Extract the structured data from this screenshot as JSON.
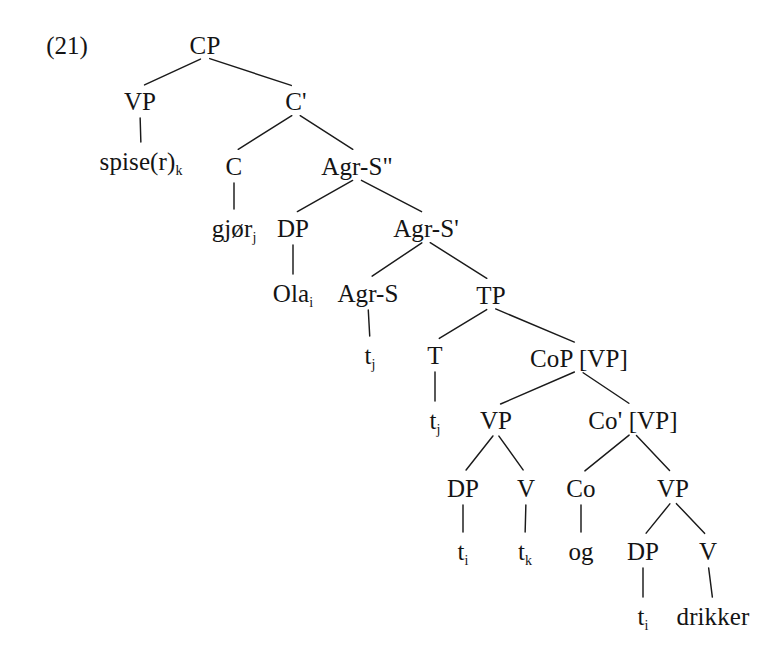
{
  "figure": {
    "example_number": "(21)",
    "language": "Norwegian",
    "sentence_gloss": "Ola gjør spise(r) og drikker",
    "width": 777,
    "height": 658,
    "background_color": "#ffffff",
    "line_color": "#1a1a1a",
    "text_color": "#141414"
  },
  "tree": {
    "type": "syntax-tree",
    "nodes": [
      {
        "id": "cp",
        "label": "CP",
        "x": 205,
        "y": 45,
        "kind": "phrase"
      },
      {
        "id": "vp1",
        "label": "VP",
        "x": 140,
        "y": 101,
        "kind": "phrase"
      },
      {
        "id": "cbar",
        "label": "C'",
        "x": 296,
        "y": 101,
        "kind": "bar"
      },
      {
        "id": "spise",
        "label": "spise(r)",
        "sub": "k",
        "x": 141,
        "y": 161,
        "kind": "terminal"
      },
      {
        "id": "c",
        "label": "C",
        "x": 234,
        "y": 166,
        "kind": "head"
      },
      {
        "id": "agrs2",
        "label": "Agr-S\"",
        "x": 357,
        "y": 166,
        "kind": "phrase"
      },
      {
        "id": "gjor",
        "label": "gjør",
        "sub": "j",
        "x": 234,
        "y": 228,
        "kind": "terminal"
      },
      {
        "id": "dp1",
        "label": "DP",
        "x": 293,
        "y": 228,
        "kind": "phrase"
      },
      {
        "id": "agrsbar",
        "label": "Agr-S'",
        "x": 426,
        "y": 228,
        "kind": "bar"
      },
      {
        "id": "ola",
        "label": "Ola",
        "sub": "i",
        "x": 293,
        "y": 293,
        "kind": "terminal"
      },
      {
        "id": "agrs",
        "label": "Agr-S",
        "x": 368,
        "y": 293,
        "kind": "head"
      },
      {
        "id": "tp",
        "label": "TP",
        "x": 491,
        "y": 295,
        "kind": "phrase"
      },
      {
        "id": "tj1",
        "label": "t",
        "sub": "j",
        "x": 370,
        "y": 355,
        "kind": "trace"
      },
      {
        "id": "t",
        "label": "T",
        "x": 435,
        "y": 355,
        "kind": "head"
      },
      {
        "id": "cop",
        "label": "CoP [VP]",
        "x": 579,
        "y": 358,
        "kind": "phrase"
      },
      {
        "id": "tj2",
        "label": "t",
        "sub": "j",
        "x": 435,
        "y": 420,
        "kind": "trace"
      },
      {
        "id": "vp2",
        "label": "VP",
        "x": 496,
        "y": 420,
        "kind": "phrase"
      },
      {
        "id": "cobar",
        "label": "Co' [VP]",
        "x": 633,
        "y": 420,
        "kind": "bar"
      },
      {
        "id": "dp2",
        "label": "DP",
        "x": 463,
        "y": 488,
        "kind": "phrase"
      },
      {
        "id": "v1",
        "label": "V",
        "x": 526,
        "y": 488,
        "kind": "head"
      },
      {
        "id": "co",
        "label": "Co",
        "x": 581,
        "y": 488,
        "kind": "head"
      },
      {
        "id": "vp3",
        "label": "VP",
        "x": 673,
        "y": 488,
        "kind": "phrase"
      },
      {
        "id": "ti1",
        "label": "t",
        "sub": "i",
        "x": 463,
        "y": 551,
        "kind": "trace"
      },
      {
        "id": "tk",
        "label": "t",
        "sub": "k",
        "x": 525,
        "y": 551,
        "kind": "trace"
      },
      {
        "id": "og",
        "label": "og",
        "x": 581,
        "y": 551,
        "kind": "terminal"
      },
      {
        "id": "dp3",
        "label": "DP",
        "x": 643,
        "y": 551,
        "kind": "phrase"
      },
      {
        "id": "v2",
        "label": "V",
        "x": 708,
        "y": 551,
        "kind": "head"
      },
      {
        "id": "ti2",
        "label": "t",
        "sub": "i",
        "x": 643,
        "y": 616,
        "kind": "trace"
      },
      {
        "id": "drikker",
        "label": "drikker",
        "x": 713,
        "y": 616,
        "kind": "terminal"
      }
    ],
    "edges": [
      {
        "from": "cp",
        "to": "vp1"
      },
      {
        "from": "cp",
        "to": "cbar"
      },
      {
        "from": "vp1",
        "to": "spise"
      },
      {
        "from": "cbar",
        "to": "c"
      },
      {
        "from": "cbar",
        "to": "agrs2"
      },
      {
        "from": "c",
        "to": "gjor"
      },
      {
        "from": "agrs2",
        "to": "dp1"
      },
      {
        "from": "agrs2",
        "to": "agrsbar"
      },
      {
        "from": "dp1",
        "to": "ola"
      },
      {
        "from": "agrsbar",
        "to": "agrs"
      },
      {
        "from": "agrsbar",
        "to": "tp"
      },
      {
        "from": "agrs",
        "to": "tj1"
      },
      {
        "from": "tp",
        "to": "t"
      },
      {
        "from": "tp",
        "to": "cop"
      },
      {
        "from": "t",
        "to": "tj2"
      },
      {
        "from": "cop",
        "to": "vp2"
      },
      {
        "from": "cop",
        "to": "cobar"
      },
      {
        "from": "vp2",
        "to": "dp2"
      },
      {
        "from": "vp2",
        "to": "v1"
      },
      {
        "from": "cobar",
        "to": "co"
      },
      {
        "from": "cobar",
        "to": "vp3"
      },
      {
        "from": "dp2",
        "to": "ti1"
      },
      {
        "from": "v1",
        "to": "tk"
      },
      {
        "from": "co",
        "to": "og"
      },
      {
        "from": "vp3",
        "to": "dp3"
      },
      {
        "from": "vp3",
        "to": "v2"
      },
      {
        "from": "dp3",
        "to": "ti2"
      },
      {
        "from": "v2",
        "to": "drikker"
      }
    ]
  }
}
